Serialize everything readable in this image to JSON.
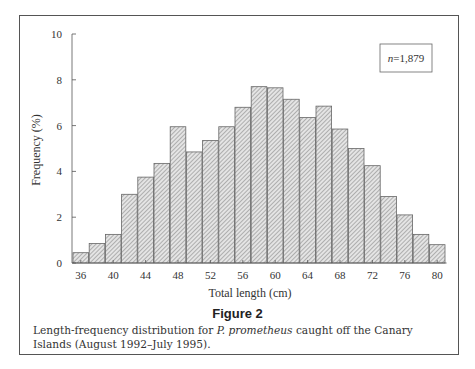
{
  "figure": {
    "title": "Figure 2",
    "caption_before": "Length-frequency distribution for ",
    "caption_species": "P. prometheus",
    "caption_after": " caught off the Canary Islands (August 1992–July 1995).",
    "sample_size_label": "n=1,879",
    "n_italic": "n",
    "n_value": "=1,879"
  },
  "chart_data": {
    "type": "bar",
    "title": "",
    "xlabel": "Total length (cm)",
    "ylabel": "Frequency (%)",
    "ylim": [
      0,
      10
    ],
    "yticks": [
      0,
      2,
      4,
      6,
      8,
      10
    ],
    "xtick_labels": [
      "36",
      "40",
      "44",
      "48",
      "52",
      "56",
      "60",
      "64",
      "68",
      "72",
      "76",
      "80"
    ],
    "categories": [
      36,
      38,
      40,
      42,
      44,
      46,
      48,
      50,
      52,
      54,
      56,
      58,
      60,
      62,
      64,
      66,
      68,
      70,
      72,
      74,
      76,
      78,
      80
    ],
    "values": [
      0.45,
      0.85,
      1.25,
      3.0,
      3.75,
      4.35,
      5.95,
      4.85,
      5.35,
      5.95,
      6.8,
      7.7,
      7.65,
      7.15,
      6.35,
      6.85,
      5.85,
      5.0,
      4.25,
      2.9,
      2.1,
      1.25,
      0.8
    ],
    "annotation": "n=1,879",
    "grid": false,
    "legend": null,
    "bar_fill": "hatched-gray",
    "colors": {
      "bar_fill": "#c8c8c8",
      "bar_stroke": "#666666",
      "axis": "#555555",
      "text": "#333333"
    }
  }
}
